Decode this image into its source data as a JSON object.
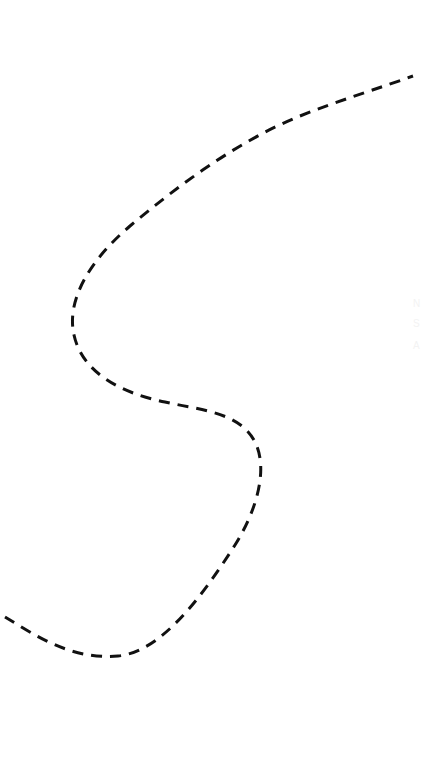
{
  "canvas": {
    "background": "#ffffff",
    "description": "Dashed freehand S-shaped curve on a blank white canvas"
  },
  "path": {
    "name": "dashed-curve",
    "stroke_color": "#111111",
    "style": "dashed"
  },
  "ghost_marks": [
    "N",
    "S",
    "A"
  ]
}
